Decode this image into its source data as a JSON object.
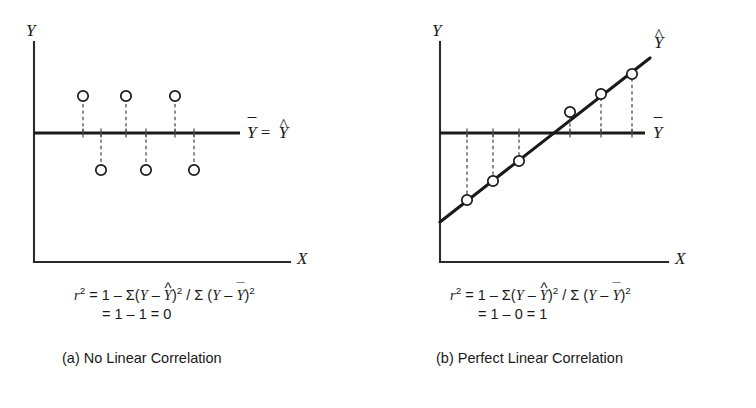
{
  "figure": {
    "background": "#ffffff",
    "ink_color": "#1a1a1a",
    "panel_count": 2
  },
  "panels": [
    {
      "id": "a",
      "caption": "(a) No Linear Correlation",
      "axis": {
        "y_label": "Y",
        "x_label": "X",
        "y_axis": {
          "x": 34,
          "y_top": 42,
          "y_bottom": 262
        },
        "x_axis": {
          "y": 262,
          "x_left": 34,
          "x_right": 290
        },
        "y_label_pos": {
          "x": 26,
          "y": 22
        },
        "x_label_pos": {
          "x": 297,
          "y": 250
        }
      },
      "mean_line": {
        "label_base": "Y",
        "label_mark": "¯",
        "label2_base": "Y",
        "label2_mark": "^",
        "equals": "=",
        "x_start": 34,
        "x_end": 240,
        "y": 133,
        "label_pos": {
          "x": 247,
          "y": 124
        }
      },
      "fit_line": null,
      "points": [
        {
          "x": 83,
          "y": 96,
          "base_y": 133,
          "r": 5.2
        },
        {
          "x": 101,
          "y": 170,
          "base_y": 133,
          "r": 5.2
        },
        {
          "x": 126,
          "y": 96,
          "base_y": 133,
          "r": 5.2
        },
        {
          "x": 146,
          "y": 170,
          "base_y": 133,
          "r": 5.2
        },
        {
          "x": 175,
          "y": 96,
          "base_y": 133,
          "r": 5.2
        },
        {
          "x": 194,
          "y": 170,
          "base_y": 133,
          "r": 5.2
        }
      ],
      "formula": {
        "lhs": "r",
        "lhs_exp": "2",
        "rhs_prefix": "= 1 – Σ(",
        "y1": "Y",
        "minus": " – ",
        "yhat_base": "Y",
        "yhat_mark": "^",
        "close_exp": ")",
        "exp2": "2",
        "divider": " / Σ (",
        "y2": "Y",
        "ybar_base": "Y",
        "ybar_mark": "¯",
        "tail": ")",
        "tail_exp": "2",
        "line2": "= 1 – 1 = 0",
        "pos": {
          "x": 74,
          "y": 284
        },
        "line2_pos": {
          "x": 102,
          "y": 306
        }
      },
      "caption_pos": {
        "x": 62,
        "y": 350
      }
    },
    {
      "id": "b",
      "caption": "(b) Perfect Linear Correlation",
      "axis": {
        "y_label": "Y",
        "x_label": "X",
        "y_axis": {
          "x": 62,
          "y_top": 42,
          "y_bottom": 262
        },
        "x_axis": {
          "y": 262,
          "x_left": 62,
          "x_right": 290
        },
        "y_label_pos": {
          "x": 54,
          "y": 22
        },
        "x_label_pos": {
          "x": 297,
          "y": 250
        }
      },
      "mean_line": {
        "label_base": "Y",
        "label_mark": "¯",
        "label2_base": null,
        "label2_mark": null,
        "equals": null,
        "x_start": 62,
        "x_end": 267,
        "y": 133,
        "label_pos": {
          "x": 275,
          "y": 124
        }
      },
      "fit_line": {
        "x1": 62,
        "y1": 222,
        "x2": 272,
        "y2": 58,
        "label_base": "Y",
        "label_mark": "^",
        "label_pos": {
          "x": 276,
          "y": 34
        }
      },
      "points": [
        {
          "x": 89,
          "y": 200,
          "base_y": 133,
          "r": 5.2
        },
        {
          "x": 115,
          "y": 181,
          "base_y": 133,
          "r": 5.2
        },
        {
          "x": 141,
          "y": 161,
          "base_y": 133,
          "r": 5.2
        },
        {
          "x": 192,
          "y": 112,
          "base_y": 133,
          "r": 5.2
        },
        {
          "x": 223,
          "y": 94,
          "base_y": 133,
          "r": 5.2
        },
        {
          "x": 254,
          "y": 74,
          "base_y": 133,
          "r": 5.2
        }
      ],
      "formula": {
        "lhs": "r",
        "lhs_exp": "2",
        "rhs_prefix": "= 1 – Σ(",
        "y1": "Y",
        "minus": " – ",
        "yhat_base": "Y",
        "yhat_mark": "^",
        "close_exp": ")",
        "exp2": "2",
        "divider": " / Σ (",
        "y2": "Y",
        "ybar_base": "Y",
        "ybar_mark": "¯",
        "tail": ")",
        "tail_exp": "2",
        "line2": "= 1 – 0 = 1",
        "pos": {
          "x": 72,
          "y": 284
        },
        "line2_pos": {
          "x": 100,
          "y": 306
        }
      },
      "caption_pos": {
        "x": 58,
        "y": 350
      }
    }
  ],
  "chart_data": {
    "type": "scatter",
    "title": "",
    "xlabel": "X",
    "ylabel": "Y",
    "grid": false,
    "legend": "none",
    "subplots": [
      {
        "name": "(a) No Linear Correlation",
        "description": "Six observations alternating above and below the mean line; the regression line coincides with the mean, so explained variance is zero.",
        "mean_value": 0,
        "regression_slope": 0,
        "r_squared": 0,
        "x": [
          1,
          2,
          3,
          4,
          5,
          6
        ],
        "y": [
          1,
          -1,
          1,
          -1,
          1,
          -1
        ],
        "yhat": [
          0,
          0,
          0,
          0,
          0,
          0
        ],
        "ybar": 0
      },
      {
        "name": "(b) Perfect Linear Correlation",
        "description": "Six observations lying exactly on the upward-sloping regression line; residuals are zero so all variance is explained.",
        "mean_value": 0,
        "regression_slope": 1,
        "r_squared": 1,
        "x": [
          1,
          2,
          3,
          4,
          5,
          6
        ],
        "y": [
          -2.5,
          -1.5,
          -0.5,
          0.5,
          1.5,
          2.5
        ],
        "yhat": [
          -2.5,
          -1.5,
          -0.5,
          0.5,
          1.5,
          2.5
        ],
        "ybar": 0
      }
    ]
  }
}
